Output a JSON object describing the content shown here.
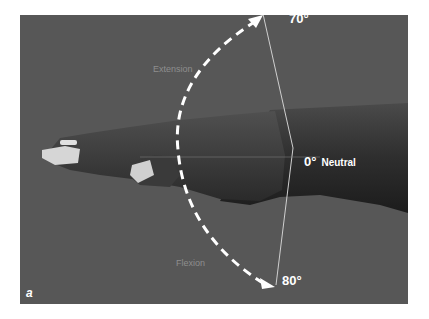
{
  "figure": {
    "letter": "a",
    "labels": {
      "extension_angle": "70°",
      "neutral_angle": "0°",
      "neutral_word": "Neutral",
      "flexion_angle": "80°",
      "extension_word": "Extension",
      "flexion_word": "Flexion"
    },
    "colors": {
      "background": "#575757",
      "skin_dark": "#2b2b2b",
      "skin_mid": "#444444",
      "nail": "#d9d9d9",
      "arrow": "#ffffff",
      "guide_line": "#c8c8c8",
      "soft_label": "#8e8e8e"
    }
  }
}
